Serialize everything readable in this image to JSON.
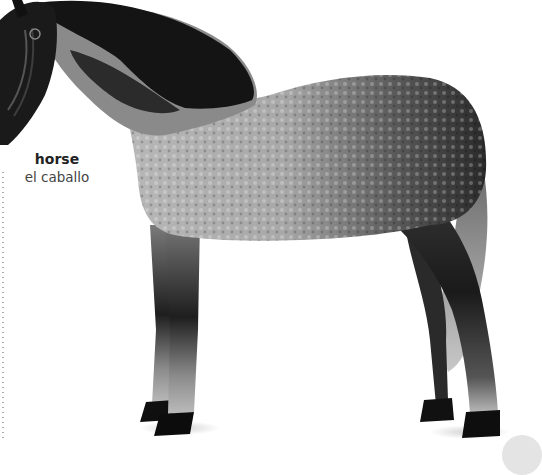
{
  "label": {
    "english": "horse",
    "spanish": "el caballo"
  },
  "image": {
    "subject": "dapple-gray horse standing in profile",
    "icon": "horse-photo"
  },
  "colors": {
    "background": "#ffffff",
    "label_primary": "#222222",
    "label_secondary": "#444444",
    "leader_dots": "#a8a8a8",
    "corner_tab": "#e4e4e4"
  }
}
